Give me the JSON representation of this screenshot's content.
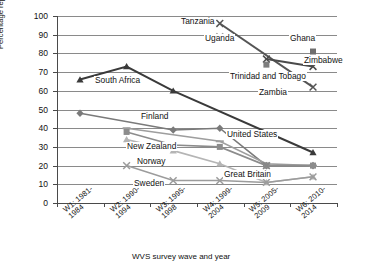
{
  "chart_data": {
    "type": "line",
    "title": "",
    "xlabel": "WVS survey wave and year",
    "ylabel": "Percentage reporting that homosexuality is never justified",
    "ylim": [
      0,
      100
    ],
    "ytick_step": 10,
    "grid": true,
    "legend_position": "inline-annotations",
    "categories": [
      "W1: 1981-1984",
      "W2: 1990-1994",
      "W3: 1995-1998",
      "W4: 1999-2004",
      "W5: 2005-2009",
      "W6: 2010-2014"
    ],
    "yticks": [
      "0",
      "10",
      "20",
      "30",
      "40",
      "50",
      "60",
      "70",
      "80",
      "90",
      "100"
    ],
    "series": [
      {
        "name": "South Africa",
        "marker": "triangle",
        "color": "#3a3a3a",
        "values": [
          66,
          73,
          60,
          null,
          null,
          27
        ]
      },
      {
        "name": "Tanzania",
        "marker": "cross",
        "color": "#555555",
        "values": [
          null,
          null,
          null,
          96,
          null,
          62
        ]
      },
      {
        "name": "Uganda",
        "marker": "cross",
        "color": "#9a9a9a",
        "values": [
          null,
          null,
          null,
          89,
          null,
          null
        ]
      },
      {
        "name": "Ghana",
        "marker": "square",
        "color": "#6e6e6e",
        "values": [
          null,
          null,
          null,
          null,
          null,
          81
        ]
      },
      {
        "name": "Zimbabwe",
        "marker": "cross",
        "color": "#4a4a4a",
        "values": [
          null,
          null,
          null,
          null,
          77,
          73
        ]
      },
      {
        "name": "Trinidad and Tobago",
        "marker": "square",
        "color": "#7d7d7d",
        "values": [
          null,
          null,
          null,
          null,
          74,
          null
        ]
      },
      {
        "name": "Zambia",
        "marker": "dash",
        "color": "#555555",
        "values": [
          null,
          null,
          null,
          null,
          null,
          null
        ]
      },
      {
        "name": "Finland",
        "marker": "diamond",
        "color": "#7a7a7a",
        "values": [
          48,
          null,
          39,
          40,
          20,
          20
        ]
      },
      {
        "name": "United States",
        "marker": "dash",
        "color": "#9e9e9e",
        "values": [
          null,
          40,
          null,
          33,
          21,
          20
        ]
      },
      {
        "name": "New Zealand",
        "marker": "square",
        "color": "#8c8c8c",
        "values": [
          null,
          38,
          31,
          30,
          20,
          20
        ]
      },
      {
        "name": "Norway",
        "marker": "triangle",
        "color": "#b5b5b5",
        "values": [
          null,
          34,
          28,
          21,
          11,
          14
        ]
      },
      {
        "name": "Sweden",
        "marker": "cross",
        "color": "#9c9c9c",
        "values": [
          null,
          20,
          12,
          12,
          11,
          14
        ]
      },
      {
        "name": "Great Britain",
        "marker": "cross",
        "color": "#888888",
        "values": [
          null,
          null,
          null,
          null,
          20,
          null
        ]
      }
    ],
    "annotations": [
      {
        "text": "Tanzania",
        "x": 180,
        "y": 17
      },
      {
        "text": "Uganda",
        "x": 204,
        "y": 34
      },
      {
        "text": "Ghana",
        "x": 289,
        "y": 34
      },
      {
        "text": "Zimbabwe",
        "x": 303,
        "y": 56
      },
      {
        "text": "Trinidad and Tobago",
        "x": 229,
        "y": 72
      },
      {
        "text": "Zambia",
        "x": 258,
        "y": 88
      },
      {
        "text": "South Africa",
        "x": 94,
        "y": 76
      },
      {
        "text": "Finland",
        "x": 140,
        "y": 112
      },
      {
        "text": "United States",
        "x": 226,
        "y": 130
      },
      {
        "text": "New Zealand",
        "x": 126,
        "y": 142
      },
      {
        "text": "Norway",
        "x": 136,
        "y": 157
      },
      {
        "text": "Great Britain",
        "x": 223,
        "y": 170
      },
      {
        "text": "Sweden",
        "x": 133,
        "y": 179
      }
    ]
  }
}
